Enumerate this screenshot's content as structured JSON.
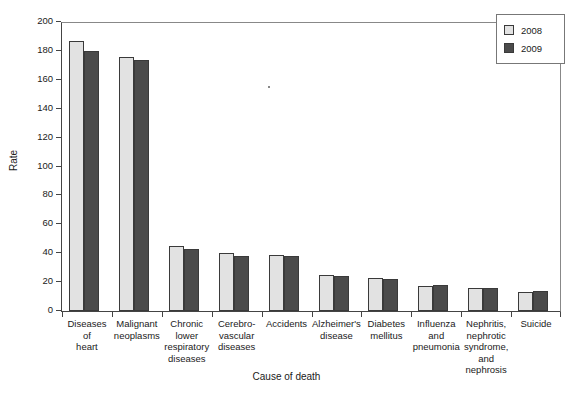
{
  "chart_data": {
    "type": "bar",
    "title": "",
    "xlabel": "Cause of death",
    "ylabel": "Rate",
    "ylim": [
      0,
      200
    ],
    "yticks": [
      0,
      20,
      40,
      60,
      80,
      100,
      120,
      140,
      160,
      180,
      200
    ],
    "grid": false,
    "legend_position": "top-right",
    "categories": [
      "Diseases\nof\nheart",
      "Malignant\nneoplasms",
      "Chronic\nlower\nrespiratory\ndiseases",
      "Cerebro-\nvascular\ndiseases",
      "Accidents",
      "Alzheimer's\ndisease",
      "Diabetes\nmellitus",
      "Influenza\nand\npneumonia",
      "Nephritis,\nnephrotic\nsyndrome,\nand\nnephrosis",
      "Suicide"
    ],
    "category_labels": [
      [
        "Diseases",
        "of",
        "heart"
      ],
      [
        "Malignant",
        "neoplasms"
      ],
      [
        "Chronic",
        "lower",
        "respiratory",
        "diseases"
      ],
      [
        "Cerebro-",
        "vascular",
        "diseases"
      ],
      [
        "Accidents"
      ],
      [
        "Alzheimer's",
        "disease"
      ],
      [
        "Diabetes",
        "mellitus"
      ],
      [
        "Influenza",
        "and",
        "pneumonia"
      ],
      [
        "Nephritis,",
        "nephrotic",
        "syndrome,",
        "and",
        "nephrosis"
      ],
      [
        "Suicide"
      ]
    ],
    "series": [
      {
        "name": "2008",
        "color": "#e2e2e2",
        "values": [
          187,
          176,
          45,
          40,
          39,
          25,
          23,
          17,
          16,
          13
        ]
      },
      {
        "name": "2009",
        "color": "#4b4b4b",
        "values": [
          180,
          174,
          43,
          38,
          38,
          24,
          22,
          18,
          16,
          14
        ]
      }
    ]
  },
  "legend": {
    "entries": [
      {
        "label": "2008",
        "color": "#e2e2e2"
      },
      {
        "label": "2009",
        "color": "#4b4b4b"
      }
    ]
  },
  "axes": {
    "y_title": "Rate",
    "x_title": "Cause of death"
  }
}
